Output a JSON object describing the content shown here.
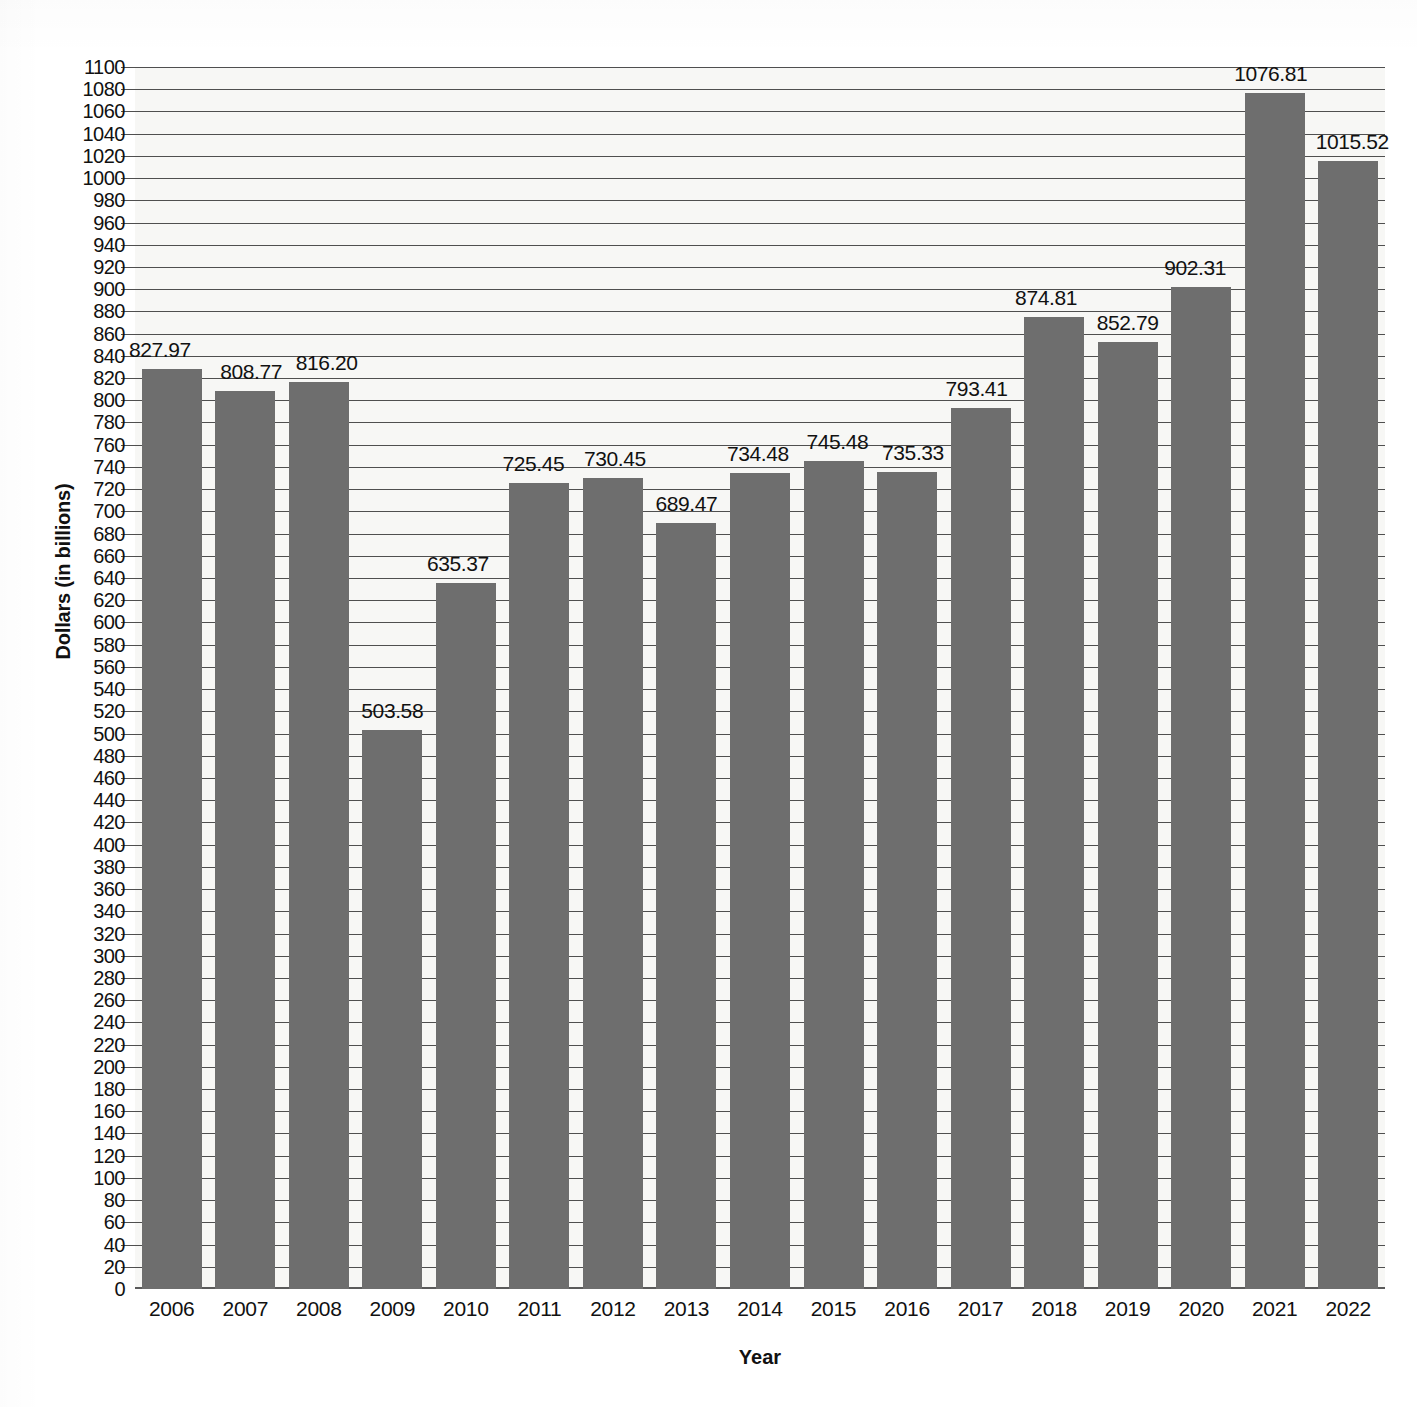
{
  "chart_data": {
    "type": "bar",
    "title": "",
    "xlabel": "Year",
    "ylabel": "Dollars (in billions)",
    "categories": [
      "2006",
      "2007",
      "2008",
      "2009",
      "2010",
      "2011",
      "2012",
      "2013",
      "2014",
      "2015",
      "2016",
      "2017",
      "2018",
      "2019",
      "2020",
      "2021",
      "2022"
    ],
    "values": [
      827.97,
      808.77,
      816.2,
      503.58,
      635.37,
      725.45,
      730.45,
      689.47,
      734.48,
      745.48,
      735.33,
      793.41,
      874.81,
      852.79,
      902.31,
      1076.81,
      1015.52
    ],
    "value_labels": [
      "827.97",
      "808.77",
      "816.20",
      "503.58",
      "635.37",
      "725.45",
      "730.45",
      "689.47",
      "734.48",
      "745.48",
      "735.33",
      "793.41",
      "874.81",
      "852.79",
      "902.31",
      "1076.81",
      "1015.52"
    ],
    "ylim": [
      0,
      1100
    ],
    "ytick_step": 20,
    "yticks": [
      1100,
      1080,
      1060,
      1040,
      1020,
      1000,
      980,
      960,
      940,
      920,
      900,
      880,
      860,
      840,
      820,
      800,
      780,
      760,
      740,
      720,
      700,
      680,
      660,
      640,
      620,
      600,
      580,
      560,
      540,
      520,
      500,
      480,
      460,
      440,
      420,
      400,
      380,
      360,
      340,
      320,
      300,
      280,
      260,
      240,
      220,
      200,
      180,
      160,
      140,
      120,
      100,
      80,
      60,
      40,
      20,
      0
    ],
    "grid": true,
    "legend": "none",
    "bar_color": "#6e6e6e",
    "plot_background": "#f7f7f5",
    "gridline_color": "#4f4f4f",
    "text_color": "#111111"
  }
}
